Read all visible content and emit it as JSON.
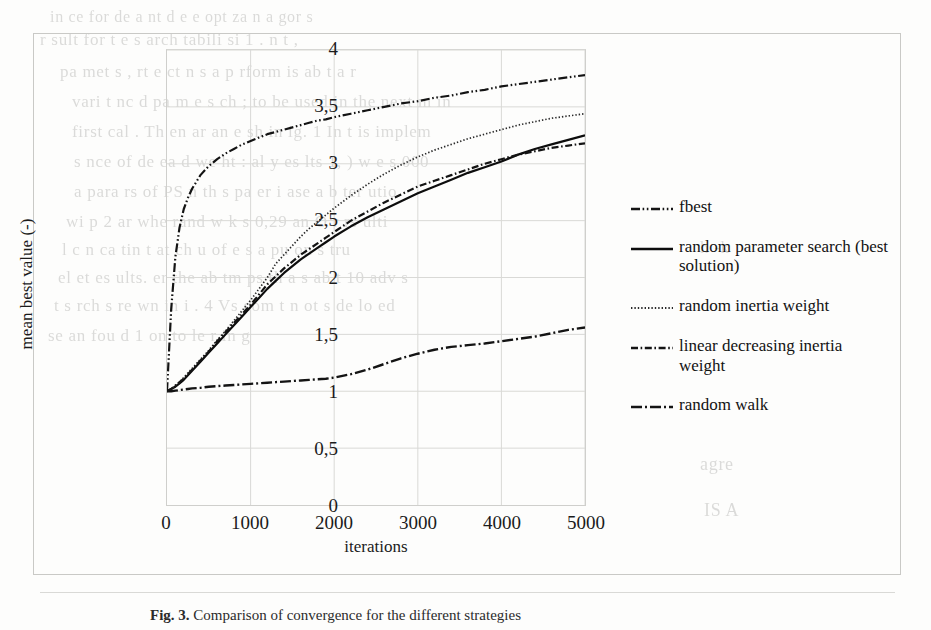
{
  "figure": {
    "caption_prefix": "Fig. 3.",
    "caption_text": "Comparison of convergence for the different strategies"
  },
  "chart_data": {
    "type": "line",
    "title": "",
    "xlabel": "iterations",
    "ylabel": "mean best value (-)",
    "xlim": [
      0,
      5000
    ],
    "ylim": [
      0,
      4
    ],
    "xticks": [
      "0",
      "1000",
      "2000",
      "3000",
      "4000",
      "5000"
    ],
    "xtick_values": [
      0,
      1000,
      2000,
      3000,
      4000,
      5000
    ],
    "yticks": [
      "0",
      "0,5",
      "1",
      "1,5",
      "2",
      "2,5",
      "3",
      "3,5",
      "4"
    ],
    "ytick_values": [
      0,
      0.5,
      1,
      1.5,
      2,
      2.5,
      3,
      3.5,
      4
    ],
    "grid": true,
    "legend_position": "right",
    "decimal_separator": ",",
    "x": [
      0,
      50,
      100,
      150,
      200,
      250,
      300,
      400,
      500,
      600,
      700,
      800,
      900,
      1000,
      1100,
      1200,
      1300,
      1400,
      1500,
      1600,
      1700,
      1800,
      1900,
      2000,
      2200,
      2400,
      2600,
      2800,
      3000,
      3200,
      3400,
      3600,
      3800,
      4000,
      4200,
      4400,
      4600,
      4800,
      5000
    ],
    "series": [
      {
        "name": "fbest",
        "style": "dash-dot-dot",
        "color": "#141414",
        "values": [
          1.0,
          1.72,
          2.18,
          2.44,
          2.6,
          2.7,
          2.78,
          2.9,
          2.98,
          3.04,
          3.09,
          3.13,
          3.17,
          3.2,
          3.23,
          3.26,
          3.28,
          3.3,
          3.32,
          3.34,
          3.36,
          3.38,
          3.39,
          3.41,
          3.44,
          3.47,
          3.5,
          3.53,
          3.55,
          3.58,
          3.6,
          3.63,
          3.65,
          3.68,
          3.7,
          3.72,
          3.74,
          3.76,
          3.78
        ]
      },
      {
        "name": "random parameter search (best solution)",
        "style": "solid",
        "color": "#0d0d0d",
        "values": [
          1.0,
          1.02,
          1.04,
          1.07,
          1.1,
          1.14,
          1.18,
          1.26,
          1.34,
          1.42,
          1.5,
          1.58,
          1.66,
          1.74,
          1.82,
          1.9,
          1.97,
          2.04,
          2.1,
          2.16,
          2.21,
          2.26,
          2.31,
          2.36,
          2.45,
          2.53,
          2.6,
          2.67,
          2.74,
          2.8,
          2.86,
          2.92,
          2.97,
          3.02,
          3.08,
          3.13,
          3.17,
          3.21,
          3.25
        ]
      },
      {
        "name": "random inertia weight",
        "style": "dotted",
        "color": "#2a2a2a",
        "values": [
          1.0,
          1.02,
          1.05,
          1.08,
          1.12,
          1.16,
          1.2,
          1.28,
          1.36,
          1.45,
          1.53,
          1.62,
          1.71,
          1.8,
          1.9,
          2.0,
          2.12,
          2.2,
          2.28,
          2.36,
          2.43,
          2.49,
          2.55,
          2.61,
          2.72,
          2.82,
          2.91,
          2.99,
          3.06,
          3.12,
          3.17,
          3.22,
          3.26,
          3.3,
          3.34,
          3.37,
          3.4,
          3.42,
          3.44
        ]
      },
      {
        "name": "linear decreasing inertia weight",
        "style": "dash-dot",
        "color": "#141414",
        "values": [
          1.0,
          1.02,
          1.05,
          1.08,
          1.11,
          1.15,
          1.19,
          1.27,
          1.35,
          1.44,
          1.52,
          1.6,
          1.68,
          1.76,
          1.85,
          1.94,
          2.01,
          2.08,
          2.14,
          2.2,
          2.25,
          2.3,
          2.35,
          2.4,
          2.5,
          2.58,
          2.66,
          2.73,
          2.8,
          2.85,
          2.9,
          2.95,
          3.0,
          3.04,
          3.08,
          3.11,
          3.14,
          3.16,
          3.18
        ]
      },
      {
        "name": "random walk",
        "style": "long-dash-dot",
        "color": "#141414",
        "values": [
          1.0,
          1.0,
          1.005,
          1.01,
          1.015,
          1.02,
          1.025,
          1.03,
          1.04,
          1.045,
          1.05,
          1.055,
          1.06,
          1.065,
          1.07,
          1.075,
          1.08,
          1.085,
          1.09,
          1.095,
          1.1,
          1.105,
          1.11,
          1.12,
          1.15,
          1.19,
          1.24,
          1.29,
          1.33,
          1.365,
          1.39,
          1.405,
          1.42,
          1.44,
          1.46,
          1.48,
          1.51,
          1.54,
          1.56
        ]
      }
    ]
  },
  "ghost_text": [
    {
      "x": 50,
      "y": 8,
      "size": 16,
      "text": "in ce  for  de   a nt   d  e e opt  za   n a gor   s"
    },
    {
      "x": 40,
      "y": 30,
      "size": 17,
      "text": "r  sult   for t   e  s  arch   tabili    si      1  .   n  t ,"
    },
    {
      "x": 60,
      "y": 62,
      "size": 17,
      "text": "pa  met  s ,  rt  e   ct  n  s   a  p rform  is ab    t   a   r"
    },
    {
      "x": 72,
      "y": 92,
      "size": 17,
      "text": "vari   t    nc  d     pa  m  e    s   ch  ;  to  be used  in  the  next  m   in"
    },
    {
      "x": 72,
      "y": 122,
      "size": 17,
      "text": "first   cal   .  Th    en   ar  an   e  sh    in   ig. 1   In  t  is  implem"
    },
    {
      "x": 74,
      "y": 152,
      "size": 17,
      "text": "s   nce of  de  ea   d   we   ht  :   al  y  es   lts  1,   ) w   e  s  000"
    },
    {
      "x": 74,
      "y": 182,
      "size": 17,
      "text": "a   para  rs  of   PS   n  th   s    pa  er     i   ase  a  b   ter  utio"
    },
    {
      "x": 66,
      "y": 212,
      "size": 17,
      "text": "wi   p   2    ar  whe  rand  w     k  s   0,29   an     O      r   rs  ulti"
    },
    {
      "x": 62,
      "y": 240,
      "size": 17,
      "text": "l   c   n   ca   tin   t   at  ch    u  of   e  s   a  pu  on    s   tru"
    },
    {
      "x": 58,
      "y": 268,
      "size": 17,
      "text": "el   et   es  ults.  er  the  ab   tm    ps   th  a   s  ab  t   10  adv   s"
    },
    {
      "x": 54,
      "y": 296,
      "size": 17,
      "text": "t  s  rch   s   re    wn  in  i   . 4  Vs  com    t   n  ot   s  de   lo  ed"
    },
    {
      "x": 48,
      "y": 326,
      "size": 17,
      "text": "se     an  fou   d  1   on   to    le  r   in    g"
    },
    {
      "x": 64,
      "y": 214,
      "size": 17,
      "text": ""
    },
    {
      "x": 700,
      "y": 238,
      "size": 17,
      "text": "h   -k"
    },
    {
      "x": 700,
      "y": 268,
      "size": 16,
      "text": ""
    },
    {
      "x": 690,
      "y": 300,
      "size": 17,
      "text": ""
    },
    {
      "x": 694,
      "y": 408,
      "size": 17,
      "text": ""
    },
    {
      "x": 700,
      "y": 454,
      "size": 18,
      "text": "agre"
    },
    {
      "x": 704,
      "y": 500,
      "size": 18,
      "text": "IS A"
    },
    {
      "x": 150,
      "y": 540,
      "size": 17,
      "text": ""
    },
    {
      "x": 300,
      "y": 545,
      "size": 16,
      "text": ""
    }
  ]
}
